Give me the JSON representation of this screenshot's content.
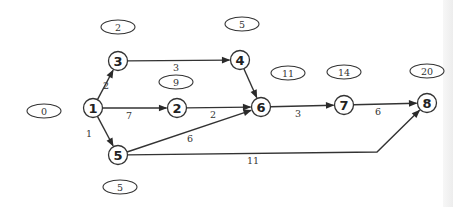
{
  "diagram": {
    "type": "activity-network",
    "colors": {
      "stroke": "#333333",
      "background": "#ffffff"
    },
    "nodes": [
      {
        "id": "1",
        "label": "1",
        "x": 93,
        "y": 108
      },
      {
        "id": "2",
        "label": "2",
        "x": 177,
        "y": 108
      },
      {
        "id": "3",
        "label": "3",
        "x": 118,
        "y": 61
      },
      {
        "id": "4",
        "label": "4",
        "x": 240,
        "y": 60
      },
      {
        "id": "5",
        "label": "5",
        "x": 118,
        "y": 155
      },
      {
        "id": "6",
        "label": "6",
        "x": 261,
        "y": 107
      },
      {
        "id": "7",
        "label": "7",
        "x": 344,
        "y": 105
      },
      {
        "id": "8",
        "label": "8",
        "x": 427,
        "y": 103
      }
    ],
    "edges": [
      {
        "from": "1",
        "to": "3",
        "label": "2",
        "label_x": 106,
        "label_y": 89
      },
      {
        "from": "1",
        "to": "2",
        "label": "7",
        "label_x": 129,
        "label_y": 119
      },
      {
        "from": "1",
        "to": "5",
        "label": "1",
        "label_x": 89,
        "label_y": 137
      },
      {
        "from": "3",
        "to": "4",
        "label": "3",
        "label_x": 176,
        "label_y": 71
      },
      {
        "from": "2",
        "to": "6",
        "label": "2",
        "label_x": 213,
        "label_y": 118
      },
      {
        "from": "4",
        "to": "6",
        "label": "",
        "label_x": 0,
        "label_y": 0
      },
      {
        "from": "5",
        "to": "6",
        "label": "6",
        "label_x": 190,
        "label_y": 142
      },
      {
        "from": "6",
        "to": "7",
        "label": "3",
        "label_x": 298,
        "label_y": 117
      },
      {
        "from": "7",
        "to": "8",
        "label": "6",
        "label_x": 378,
        "label_y": 115
      },
      {
        "from": "5",
        "to": "8",
        "label": "11",
        "label_x": 253,
        "label_y": 164
      }
    ],
    "time_ovals": [
      {
        "node": "1",
        "value": "0",
        "x": 44,
        "y": 111
      },
      {
        "node": "3",
        "value": "2",
        "x": 118,
        "y": 27
      },
      {
        "node": "4",
        "value": "5",
        "x": 242,
        "y": 24
      },
      {
        "node": "2",
        "value": "9",
        "x": 176,
        "y": 82
      },
      {
        "node": "6",
        "value": "11",
        "x": 288,
        "y": 73
      },
      {
        "node": "7",
        "value": "14",
        "x": 344,
        "y": 72
      },
      {
        "node": "8",
        "value": "20",
        "x": 427,
        "y": 71
      },
      {
        "node": "5",
        "value": "5",
        "x": 120,
        "y": 187
      }
    ]
  }
}
